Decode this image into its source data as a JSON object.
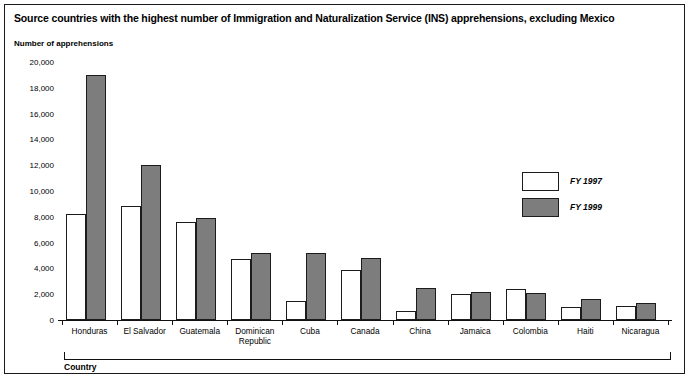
{
  "title": "Source countries with the highest number of Immigration and Naturalization Service (INS) apprehensions, excluding Mexico",
  "axis": {
    "y_title": "Number of apprehensions",
    "x_title": "Country"
  },
  "legend": {
    "items": [
      {
        "label": "FY 1997",
        "color": "#ffffff"
      },
      {
        "label": "FY 1999",
        "color": "#7d7d7d"
      }
    ]
  },
  "chart_data": {
    "type": "bar",
    "title": "Source countries with the highest number of Immigration and Naturalization Service (INS) apprehensions, excluding Mexico",
    "xlabel": "Country",
    "ylabel": "Number of apprehensions",
    "ylim": [
      0,
      20000
    ],
    "yticks": [
      0,
      2000,
      4000,
      6000,
      8000,
      10000,
      12000,
      14000,
      16000,
      18000,
      20000
    ],
    "ytick_labels": [
      "0",
      "2,000",
      "4,000",
      "6,000",
      "8,000",
      "10,000",
      "12,000",
      "14,000",
      "16,000",
      "18,000",
      "20,000"
    ],
    "grid": false,
    "legend_position": "right-inside",
    "categories": [
      "Honduras",
      "El Salvador",
      "Guatemala",
      "Dominican\nRepublic",
      "Cuba",
      "Canada",
      "China",
      "Jamaica",
      "Colombia",
      "Haiti",
      "Nicaragua"
    ],
    "series": [
      {
        "name": "FY 1997",
        "color": "#ffffff",
        "values": [
          8200,
          8800,
          7600,
          4700,
          1500,
          3900,
          700,
          2000,
          2400,
          1000,
          1100
        ]
      },
      {
        "name": "FY 1999",
        "color": "#7d7d7d",
        "values": [
          19000,
          12000,
          7900,
          5200,
          5200,
          4800,
          2500,
          2200,
          2100,
          1600,
          1300
        ]
      }
    ]
  }
}
